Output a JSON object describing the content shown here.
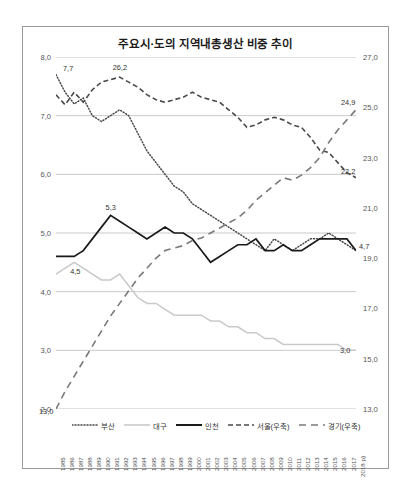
{
  "chart_data": {
    "type": "line",
    "title": "주요시·도의 지역내총생산 비중 추이",
    "xlabel": "",
    "ylabel": "",
    "grid": true,
    "legend_position": "bottom",
    "axes": {
      "left": {
        "ticks": [
          "8,0",
          "7,0",
          "6,0",
          "5,0",
          "4,0",
          "3,0",
          "2,0"
        ],
        "values": [
          8,
          7,
          6,
          5,
          4,
          3,
          2
        ],
        "ylim": [
          2,
          8
        ]
      },
      "right": {
        "ticks": [
          "27,0",
          "25,0",
          "23,0",
          "21,0",
          "19,0",
          "17,0",
          "15,0",
          "13,0"
        ],
        "values": [
          27,
          25,
          23,
          21,
          19,
          17,
          15,
          13
        ],
        "ylim": [
          13,
          27
        ]
      }
    },
    "x": [
      "1985",
      "1986",
      "1987",
      "1988",
      "1989",
      "1990",
      "1991",
      "1992",
      "1993",
      "1994",
      "1995",
      "1996",
      "1997",
      "1998",
      "1999",
      "2000",
      "2001",
      "2002",
      "2003",
      "2004",
      "2005",
      "2006",
      "2007",
      "2008",
      "2009",
      "2010",
      "2011",
      "2012",
      "2013",
      "2014",
      "2015",
      "2016",
      "2017",
      "2018 p)"
    ],
    "series": [
      {
        "name": "부산",
        "axis": "left",
        "style": "dotted",
        "color": "#4a4a4a",
        "values": [
          7.7,
          7.4,
          7.2,
          7.3,
          7.0,
          6.9,
          7.0,
          7.1,
          7.0,
          6.7,
          6.4,
          6.2,
          6.0,
          5.8,
          5.7,
          5.5,
          5.4,
          5.3,
          5.2,
          5.1,
          5.0,
          4.9,
          4.8,
          4.7,
          4.9,
          4.8,
          4.7,
          4.8,
          4.9,
          4.9,
          5.0,
          4.9,
          4.8,
          4.7
        ]
      },
      {
        "name": "대구",
        "axis": "left",
        "style": "solid",
        "color": "#c9c9c9",
        "values": [
          4.3,
          4.4,
          4.5,
          4.4,
          4.3,
          4.2,
          4.2,
          4.3,
          4.1,
          3.9,
          3.8,
          3.8,
          3.7,
          3.6,
          3.6,
          3.6,
          3.6,
          3.5,
          3.5,
          3.4,
          3.4,
          3.3,
          3.3,
          3.2,
          3.2,
          3.1,
          3.1,
          3.1,
          3.1,
          3.1,
          3.1,
          3.1,
          3.0,
          3.0
        ]
      },
      {
        "name": "인천",
        "axis": "left",
        "style": "solid",
        "color": "#1a1a1a",
        "values": [
          4.6,
          4.6,
          4.6,
          4.7,
          4.9,
          5.1,
          5.3,
          5.2,
          5.1,
          5.0,
          4.9,
          5.0,
          5.1,
          5.0,
          5.0,
          4.9,
          4.7,
          4.5,
          4.6,
          4.7,
          4.8,
          4.8,
          4.9,
          4.7,
          4.7,
          4.8,
          4.7,
          4.7,
          4.8,
          4.9,
          4.9,
          4.9,
          4.9,
          4.7
        ]
      },
      {
        "name": "서울(우축)",
        "axis": "right",
        "style": "dashed",
        "color": "#4a4a4a",
        "values": [
          25.5,
          25.1,
          25.6,
          25.2,
          25.7,
          26.0,
          26.1,
          26.2,
          26.0,
          25.8,
          25.5,
          25.3,
          25.2,
          25.3,
          25.4,
          25.6,
          25.4,
          25.3,
          25.2,
          24.9,
          24.6,
          24.2,
          24.3,
          24.5,
          24.6,
          24.5,
          24.3,
          24.2,
          23.8,
          23.3,
          23.2,
          22.8,
          22.4,
          22.2
        ]
      },
      {
        "name": "경기(우축)",
        "axis": "right",
        "style": "longdash",
        "color": "#7a7a7a",
        "values": [
          13.0,
          13.7,
          14.3,
          14.9,
          15.5,
          16.1,
          16.7,
          17.2,
          17.7,
          18.2,
          18.6,
          19.0,
          19.3,
          19.4,
          19.5,
          19.7,
          19.8,
          20.0,
          20.2,
          20.4,
          20.6,
          20.9,
          21.3,
          21.6,
          21.9,
          22.2,
          22.1,
          22.3,
          22.6,
          23.0,
          23.6,
          24.1,
          24.5,
          24.9
        ]
      }
    ],
    "annotations": [
      {
        "text": "7,7",
        "series": "부산",
        "x": "1985",
        "value": 7.7
      },
      {
        "text": "26,2",
        "series": "서울(우축)",
        "x": "1992",
        "value": 26.2
      },
      {
        "text": "5,3",
        "series": "인천",
        "x": "1991",
        "value": 5.3
      },
      {
        "text": "4,5",
        "series": "대구",
        "x": "1987",
        "value": 4.5
      },
      {
        "text": "13,0",
        "series": "경기(우축)",
        "x": "1985",
        "value": 13.0
      },
      {
        "text": "24,9",
        "series": "경기(우축)",
        "x": "2018 p)",
        "value": 24.9
      },
      {
        "text": "22,2",
        "series": "서울(우축)",
        "x": "2018 p)",
        "value": 22.2
      },
      {
        "text": "4,7",
        "series": "인천",
        "x": "2018 p)",
        "value": 4.7
      },
      {
        "text": "3,0",
        "series": "대구",
        "x": "2018 p)",
        "value": 3.0
      }
    ]
  }
}
